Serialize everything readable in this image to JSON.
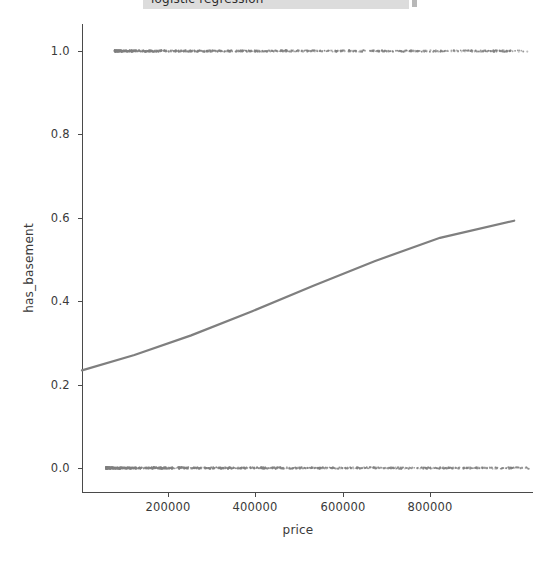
{
  "figure": {
    "top_strip": {
      "text": "logistic regression",
      "visible_caption_cut_off": true
    },
    "background_color": "#ffffff"
  },
  "axes": {
    "x_axis_label": "price",
    "y_axis_label": "has_basement",
    "x_tick_labels": [
      "200000",
      "400000",
      "600000",
      "800000"
    ],
    "y_tick_labels": [
      "0.0",
      "0.2",
      "0.4",
      "0.6",
      "0.8",
      "1.0"
    ],
    "spine_color": "#4a4a4a",
    "tick_label_color": "#3a3a3a"
  },
  "chart_data": {
    "type": "scatter",
    "title": "",
    "xlabel": "price",
    "ylabel": "has_basement",
    "xlim": [
      30000,
      1063000
    ],
    "ylim": [
      -0.04,
      1.04
    ],
    "grid": false,
    "legend": false,
    "x_ticks": [
      200000,
      400000,
      600000,
      800000
    ],
    "y_ticks": [
      0.0,
      0.2,
      0.4,
      0.6,
      0.8,
      1.0
    ],
    "series": [
      {
        "name": "observations (has_basement = 1)",
        "type": "scatter",
        "marker": "point",
        "color": "#808080",
        "y_value": 1.0,
        "x_range": [
          105000,
          1050000
        ],
        "n_points": 900,
        "density_note": "dense continuous band of overlapping points along y = 1.0, thinning toward high prices"
      },
      {
        "name": "observations (has_basement = 0)",
        "type": "scatter",
        "marker": "point",
        "color": "#808080",
        "y_value": 0.0,
        "x_range": [
          85000,
          1055000
        ],
        "n_points": 1100,
        "density_note": "dense continuous band of overlapping points along y = 0.0, thinning toward high prices"
      },
      {
        "name": "logistic fit",
        "type": "line",
        "color": "#7f7f7f",
        "linewidth": 2.2,
        "points": [
          {
            "x": 30000,
            "y": 0.234
          },
          {
            "x": 150000,
            "y": 0.271
          },
          {
            "x": 280000,
            "y": 0.318
          },
          {
            "x": 420000,
            "y": 0.376
          },
          {
            "x": 560000,
            "y": 0.437
          },
          {
            "x": 700000,
            "y": 0.496
          },
          {
            "x": 850000,
            "y": 0.552
          },
          {
            "x": 1020000,
            "y": 0.593
          }
        ],
        "endpoint_values": {
          "left_y": 0.234,
          "right_y": 0.593
        }
      }
    ]
  }
}
